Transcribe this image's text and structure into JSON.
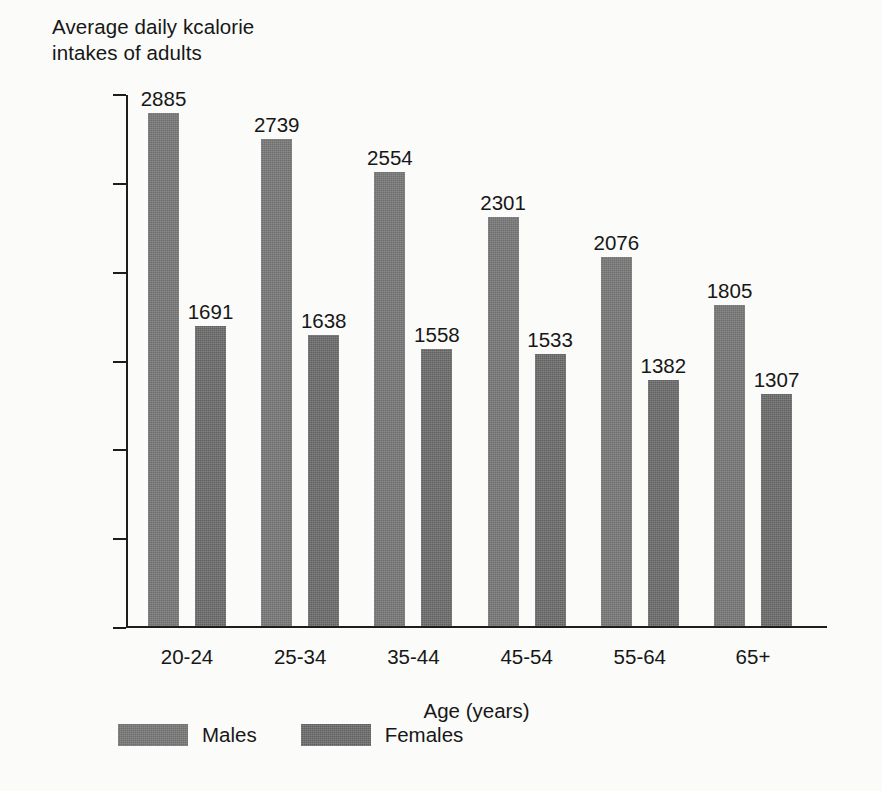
{
  "chart_data": {
    "type": "bar",
    "title": "Average daily kcalorie\nintakes of adults",
    "xlabel": "Age (years)",
    "ylabel": "",
    "categories": [
      "20-24",
      "25-34",
      "35-44",
      "45-54",
      "55-64",
      "65+"
    ],
    "series": [
      {
        "name": "Males",
        "values": [
          2885,
          2739,
          2554,
          2301,
          2076,
          1805
        ],
        "color": "#7b7b7b"
      },
      {
        "name": "Females",
        "values": [
          1691,
          1638,
          1558,
          1533,
          1382,
          1307
        ],
        "color": "#6f6f6f"
      }
    ],
    "ylim": [
      0,
      3000
    ],
    "y_ticks": [
      0,
      500,
      1000,
      1500,
      2000,
      2500,
      3000
    ],
    "y_tick_labels": [
      "0",
      "500",
      "1000",
      "1500",
      "2000",
      "2500",
      "3000"
    ],
    "grid": false,
    "legend_position": "bottom-left",
    "data_labels": true
  },
  "legend": {
    "items": [
      {
        "label": "Males"
      },
      {
        "label": "Females"
      }
    ]
  },
  "axis": {
    "x_title": "Age (years)"
  }
}
